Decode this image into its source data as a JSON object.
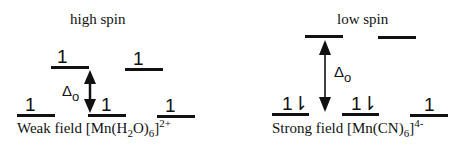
{
  "diagrams": [
    {
      "title": "high spin",
      "caption": {
        "prefix": "Weak field [Mn(H",
        "sub1": "2",
        "mid": "O)",
        "sub2": "6",
        "close": "]",
        "sup": "2+"
      },
      "delta_label": {
        "symbol": "Δ",
        "sub": "o"
      },
      "eg_levels": [
        {
          "electrons": "1"
        },
        {
          "electrons": "1"
        }
      ],
      "t2g_levels": [
        {
          "electrons": "1"
        },
        {
          "electrons": "1"
        },
        {
          "electrons": "1"
        }
      ]
    },
    {
      "title": "low spin",
      "caption": {
        "prefix": "Strong field [Mn(CN)",
        "sub2": "6",
        "close": "]",
        "sup": "4-"
      },
      "delta_label": {
        "symbol": "Δ",
        "sub": "o"
      },
      "eg_levels": [
        {
          "electrons": ""
        },
        {
          "electrons": ""
        }
      ],
      "t2g_levels": [
        {
          "electrons": "1⇂"
        },
        {
          "electrons": "1⇂"
        },
        {
          "electrons": "1"
        }
      ]
    }
  ]
}
